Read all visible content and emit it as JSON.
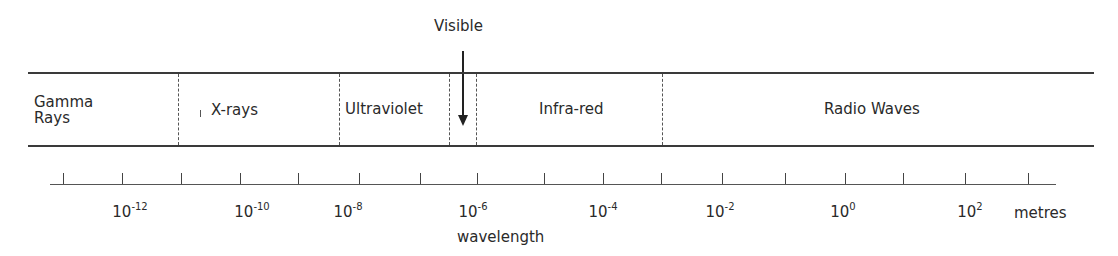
{
  "diagram": {
    "callout": {
      "label": "Visible"
    },
    "bands": [
      {
        "id": "gamma",
        "label_line1": "Gamma",
        "label_line2": "Rays"
      },
      {
        "id": "xrays",
        "label": "X-rays"
      },
      {
        "id": "ultraviolet",
        "label": "Ultraviolet"
      },
      {
        "id": "visible",
        "label": ""
      },
      {
        "id": "infrared",
        "label": "Infra-red"
      },
      {
        "id": "radio",
        "label": "Radio Waves"
      }
    ],
    "axis": {
      "label": "wavelength",
      "unit": "metres",
      "tick_labels": [
        {
          "base": "10",
          "exp": "-12"
        },
        {
          "base": "10",
          "exp": "-10"
        },
        {
          "base": "10",
          "exp": "-8"
        },
        {
          "base": "10",
          "exp": "-6"
        },
        {
          "base": "10",
          "exp": "-4"
        },
        {
          "base": "10",
          "exp": "-2"
        },
        {
          "base": "10",
          "exp": "0"
        },
        {
          "base": "10",
          "exp": "2"
        }
      ]
    },
    "colors": {
      "line": "#3a3a3a",
      "text": "#2a2a2a",
      "background": "#ffffff"
    }
  }
}
